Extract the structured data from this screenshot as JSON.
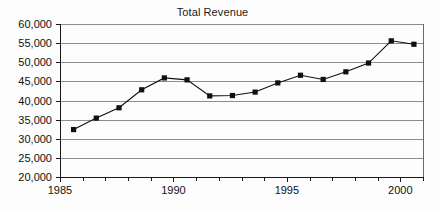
{
  "chart_data": {
    "type": "line",
    "title": "Total Revenue",
    "xlabel": "",
    "ylabel": "",
    "xlim": [
      1985,
      2001
    ],
    "ylim": [
      20000,
      60000
    ],
    "grid": "horizontal",
    "legend": "none",
    "marker": "filled-square",
    "line_color": "#101010",
    "marker_color": "#101010",
    "gridline_color": "#8d8d8d",
    "background_color": "#fdfdfd",
    "y_ticks": [
      20000,
      25000,
      30000,
      35000,
      40000,
      45000,
      50000,
      55000,
      60000
    ],
    "y_tick_labels": [
      "20,000",
      "25,000",
      "30,000",
      "35,000",
      "40,000",
      "45,000",
      "50,000",
      "55,000",
      "60,000"
    ],
    "x_ticks": [
      1985,
      1990,
      1995,
      2000
    ],
    "x_tick_labels": [
      "1985",
      "1990",
      "1995",
      "2000"
    ],
    "x_minor_ticks": [
      1986,
      1987,
      1988,
      1989,
      1991,
      1992,
      1993,
      1994,
      1996,
      1997,
      1998,
      1999,
      2001
    ],
    "x": [
      1985.6,
      1986.6,
      1987.6,
      1988.6,
      1989.6,
      1990.6,
      1991.6,
      1992.6,
      1993.6,
      1994.6,
      1995.6,
      1996.6,
      1997.6,
      1998.6,
      1999.6,
      2000.6
    ],
    "values": [
      32400,
      35400,
      38100,
      42800,
      45900,
      45400,
      41200,
      41300,
      42200,
      44600,
      46600,
      45500,
      47500,
      49800,
      55600,
      54700
    ],
    "series": [
      {
        "name": "Total Revenue",
        "values": [
          32400,
          35400,
          38100,
          42800,
          45900,
          45400,
          41200,
          41300,
          42200,
          44600,
          46600,
          45500,
          47500,
          49800,
          55600,
          54700
        ]
      }
    ]
  },
  "plot_geometry": {
    "left": 60,
    "right": 423,
    "top": 24,
    "bottom": 177
  }
}
